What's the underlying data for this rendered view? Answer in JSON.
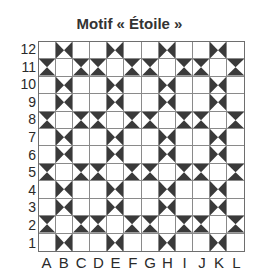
{
  "title": "Motif « Étoile »",
  "colors": {
    "dark": "#3a3a3a",
    "light": "#ffffff",
    "gridline": "#8a8a8a"
  },
  "columns": [
    "A",
    "B",
    "C",
    "D",
    "E",
    "F",
    "G",
    "H",
    "I",
    "J",
    "K",
    "L"
  ],
  "rows": [
    "12",
    "11",
    "10",
    "9",
    "8",
    "7",
    "6",
    "5",
    "4",
    "3",
    "2",
    "1"
  ],
  "cell_legend": {
    "o": "plain white square",
    "lr": "dark triangles on left and right sides (vertical star point)",
    "tb": "dark triangles on top and bottom sides (horizontal star point)"
  },
  "grid": [
    [
      "o",
      "lr",
      "o",
      "o",
      "lr",
      "o",
      "o",
      "lr",
      "o",
      "o",
      "lr",
      "o"
    ],
    [
      "tb",
      "o",
      "tb",
      "tb",
      "o",
      "tb",
      "tb",
      "o",
      "tb",
      "tb",
      "o",
      "tb"
    ],
    [
      "o",
      "lr",
      "o",
      "o",
      "lr",
      "o",
      "o",
      "lr",
      "o",
      "o",
      "lr",
      "o"
    ],
    [
      "o",
      "lr",
      "o",
      "o",
      "lr",
      "o",
      "o",
      "lr",
      "o",
      "o",
      "lr",
      "o"
    ],
    [
      "tb",
      "o",
      "tb",
      "tb",
      "o",
      "tb",
      "tb",
      "o",
      "tb",
      "tb",
      "o",
      "tb"
    ],
    [
      "o",
      "lr",
      "o",
      "o",
      "lr",
      "o",
      "o",
      "lr",
      "o",
      "o",
      "lr",
      "o"
    ],
    [
      "o",
      "lr",
      "o",
      "o",
      "lr",
      "o",
      "o",
      "lr",
      "o",
      "o",
      "lr",
      "o"
    ],
    [
      "tb",
      "o",
      "tb",
      "tb",
      "o",
      "tb",
      "tb",
      "o",
      "tb",
      "tb",
      "o",
      "tb"
    ],
    [
      "o",
      "lr",
      "o",
      "o",
      "lr",
      "o",
      "o",
      "lr",
      "o",
      "o",
      "lr",
      "o"
    ],
    [
      "o",
      "lr",
      "o",
      "o",
      "lr",
      "o",
      "o",
      "lr",
      "o",
      "o",
      "lr",
      "o"
    ],
    [
      "tb",
      "o",
      "tb",
      "tb",
      "o",
      "tb",
      "tb",
      "o",
      "tb",
      "tb",
      "o",
      "tb"
    ],
    [
      "o",
      "lr",
      "o",
      "o",
      "lr",
      "o",
      "o",
      "lr",
      "o",
      "o",
      "lr",
      "o"
    ]
  ]
}
